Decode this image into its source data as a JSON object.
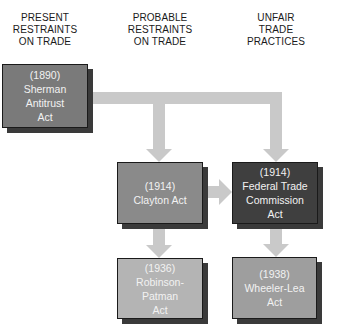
{
  "columns": [
    {
      "lines": [
        "PRESENT",
        "RESTRAINTS",
        "ON TRADE"
      ]
    },
    {
      "lines": [
        "PROBABLE",
        "RESTRAINTS",
        "ON TRADE"
      ]
    },
    {
      "lines": [
        "UNFAIR",
        "TRADE",
        "PRACTICES"
      ]
    }
  ],
  "nodes": {
    "sherman": {
      "year": "(1890)",
      "lines": [
        "Sherman",
        "Antitrust",
        "Act"
      ],
      "color": "#7a7a7a"
    },
    "clayton": {
      "year": "(1914)",
      "lines": [
        "Clayton Act"
      ],
      "color": "#8a8a8a"
    },
    "ftc": {
      "year": "(1914)",
      "lines": [
        "Federal Trade",
        "Commission",
        "Act"
      ],
      "color": "#3f3f3f"
    },
    "robinson_patman": {
      "year": "(1936)",
      "lines": [
        "Robinson-",
        "Patman",
        "Act"
      ],
      "color": "#b4b4b4"
    },
    "wheeler_lea": {
      "year": "(1938)",
      "lines": [
        "Wheeler-Lea",
        "Act"
      ],
      "color": "#9e9e9e"
    }
  },
  "edges": [
    {
      "from": "Sherman Antitrust Act",
      "to": "Clayton Act"
    },
    {
      "from": "Sherman Antitrust Act",
      "to": "Federal Trade Commission Act"
    },
    {
      "from": "Clayton Act",
      "to": "Federal Trade Commission Act"
    },
    {
      "from": "Clayton Act",
      "to": "Robinson-Patman Act"
    },
    {
      "from": "Federal Trade Commission Act",
      "to": "Wheeler-Lea Act"
    }
  ],
  "colors": {
    "arrow": "#c9c9c9",
    "shadow": "#3a3a3a",
    "text_on_box": "#f2f2f2"
  }
}
